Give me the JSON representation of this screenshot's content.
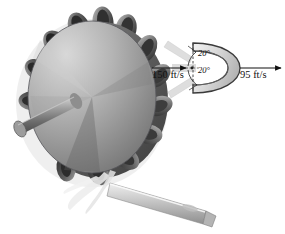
{
  "figure": {
    "background_color": "#ffffff"
  },
  "wheel": {
    "name": "pelton-wheel",
    "bucket_count": 12,
    "disc_color_light": "#c9c9c9",
    "disc_color_dark": "#6a6a6a",
    "bucket_color_dark": "#3a3a3a",
    "bucket_color_light": "#9a9a9a",
    "shaft_color": "#858585",
    "nozzle_color": "#d2d2d2",
    "spray_color": "#e8e8e8"
  },
  "detail": {
    "name": "bucket-splitter-detail",
    "bucket_fill": "#d8d8d8",
    "bucket_stroke": "#3b3b3b",
    "jet_fill": "#dcdcdc",
    "arrow_color": "#111111",
    "inlet_speed": "150 ft/s",
    "outlet_speed": "95 ft/s",
    "angle_top": "20°",
    "angle_bottom": "20°"
  }
}
